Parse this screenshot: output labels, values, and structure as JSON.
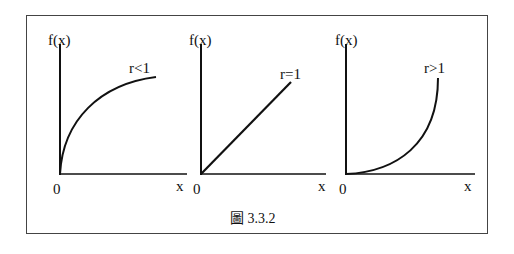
{
  "figure": {
    "caption": "圖 3.3.2",
    "panels": [
      {
        "id": "r-less-than-1",
        "y_label": "f(x)",
        "x_label": "x",
        "origin_label": "0",
        "curve_label": "r<1",
        "shape": "concave"
      },
      {
        "id": "r-equals-1",
        "y_label": "f(x)",
        "x_label": "x",
        "origin_label": "0",
        "curve_label": "r=1",
        "shape": "linear"
      },
      {
        "id": "r-greater-than-1",
        "y_label": "f(x)",
        "x_label": "x",
        "origin_label": "0",
        "curve_label": "r>1",
        "shape": "convex"
      }
    ]
  },
  "colors": {
    "ink": "#111111",
    "frame": "#444444",
    "background": "#ffffff"
  }
}
